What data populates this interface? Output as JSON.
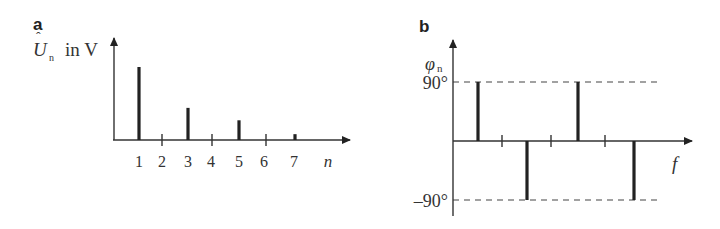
{
  "chart_data": [
    {
      "panel": "a",
      "type": "bar",
      "title": "",
      "xlabel": "n",
      "ylabel": "Û_n in V",
      "ylabel_main": "U",
      "ylabel_sub": "n",
      "ylabel_unit": "in V",
      "categories": [
        "1",
        "2",
        "3",
        "4",
        "5",
        "6",
        "7"
      ],
      "values": [
        1.0,
        0,
        0.44,
        0,
        0.27,
        0,
        0.08
      ],
      "grid": false,
      "legend": null
    },
    {
      "panel": "b",
      "type": "bar",
      "title": "",
      "xlabel": "f",
      "ylabel": "φn",
      "ylabel_main": "φ",
      "ylabel_sub": "n",
      "yticks": [
        "90°",
        "-90°"
      ],
      "ytick_90": "90°",
      "ytick_neg90": "–90°",
      "categories": [
        "1",
        "2",
        "3",
        "4",
        "5",
        "6",
        "7"
      ],
      "values": [
        90,
        null,
        -90,
        null,
        90,
        null,
        -90
      ],
      "ylim": [
        -90,
        90
      ],
      "reference_lines": [
        90,
        -90
      ],
      "grid": false,
      "legend": null
    }
  ],
  "panels": {
    "a": {
      "label": "a"
    },
    "b": {
      "label": "b"
    }
  }
}
